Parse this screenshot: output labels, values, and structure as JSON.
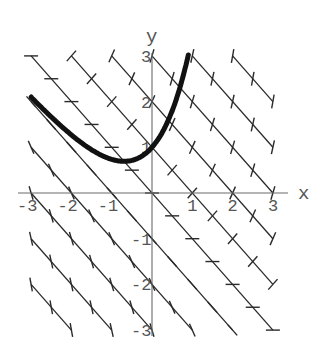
{
  "chart_data": {
    "type": "line",
    "title": "",
    "subtitle": "",
    "xlabel": "x",
    "ylabel": "y",
    "xlim": [
      -3,
      3
    ],
    "ylim": [
      -3,
      3
    ],
    "grid": false,
    "legend": null,
    "x_ticks": [
      -3,
      -2,
      -1,
      1,
      2,
      3
    ],
    "x_tick_labels": [
      "-3",
      "-2",
      "-1",
      "1",
      "2",
      "3"
    ],
    "y_ticks": [
      -3,
      -2,
      -1,
      1,
      2,
      3
    ],
    "y_tick_labels": [
      "-3",
      "-2",
      "-1",
      "1",
      "2",
      "3"
    ],
    "isoclines": {
      "equation": "x + y = c",
      "slope_equals_c": true,
      "c_values": [
        -5,
        -4,
        -3,
        -2,
        -1,
        0,
        1,
        2,
        3,
        4,
        5
      ],
      "mark_spacing_x": 0.5
    },
    "series": [
      {
        "name": "solution curve y = 2e^x - x - 1",
        "x": [
          -3,
          -2.5,
          -2,
          -1.5,
          -1,
          -0.69,
          -0.5,
          0,
          0.25,
          0.5,
          0.75,
          0.9
        ],
        "y": [
          2.1,
          1.66,
          1.27,
          0.95,
          0.74,
          0.69,
          0.71,
          1.0,
          1.32,
          1.8,
          2.48,
          3.02
        ]
      }
    ]
  },
  "axes": {
    "x_label": "x",
    "y_label": "y"
  },
  "colors": {
    "background": "#ffffff",
    "isocline": "#2a2a2a",
    "curve": "#111111",
    "axis": "#6a6a6a",
    "label": "#555555"
  }
}
